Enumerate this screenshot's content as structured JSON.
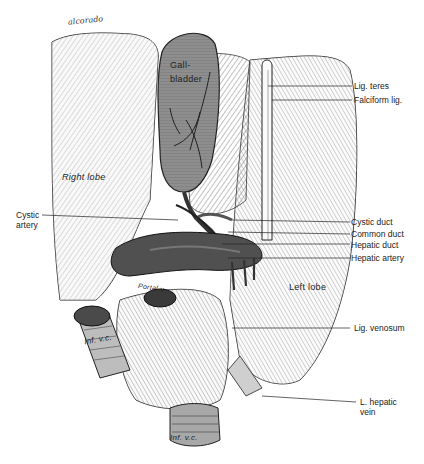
{
  "figure": {
    "type": "anatomical illustration",
    "signature": "alcorado"
  },
  "in_figure_labels": {
    "gallbladder": "Gall-\nbladder",
    "right_lobe": "Right lobe",
    "left_lobe": "Left lobe",
    "portal_v": "Portal v.",
    "inf_vc_upper": "Inf. v.c.",
    "inf_vc_lower": "Inf. v.c."
  },
  "callouts": {
    "right": [
      {
        "id": "lig_teres",
        "text": "Lig. teres"
      },
      {
        "id": "falciform_lig",
        "text": "Falciform lig."
      },
      {
        "id": "cystic_duct",
        "text": "Cystic duct"
      },
      {
        "id": "common_duct",
        "text": "Common duct"
      },
      {
        "id": "hepatic_duct",
        "text": "Hepatic duct"
      },
      {
        "id": "hepatic_artery",
        "text": "Hepatic artery"
      },
      {
        "id": "lig_venosum",
        "text": "Lig. venosum"
      },
      {
        "id": "l_hepatic_vein",
        "text": "L. hepatic\nvein"
      }
    ],
    "left": [
      {
        "id": "cystic_artery",
        "text": "Cystic\nartery"
      }
    ]
  },
  "colors": {
    "background": "#ffffff",
    "ink": "#1e1e1e",
    "liver_fill": "#e9e9e9",
    "gallbladder_fill": "#8e8e8e",
    "portal_fill": "#5a5a5a",
    "vessel_fill": "#bdbdbd"
  }
}
